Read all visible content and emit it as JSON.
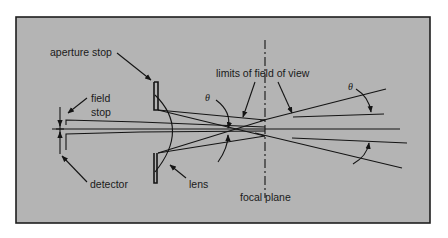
{
  "diagram": {
    "labels": {
      "aperture_stop": "aperture stop",
      "field_stop_line1": "field",
      "field_stop_line2": "stop",
      "detector": "detector",
      "lens": "lens",
      "limits_of_field_of_view": "limits of field of view",
      "focal_plane": "focal plane",
      "theta_left": "θ",
      "theta_right": "θ"
    },
    "colors": {
      "background": "#b4b4b4",
      "lines": "#141414",
      "page": "#ffffff"
    }
  }
}
